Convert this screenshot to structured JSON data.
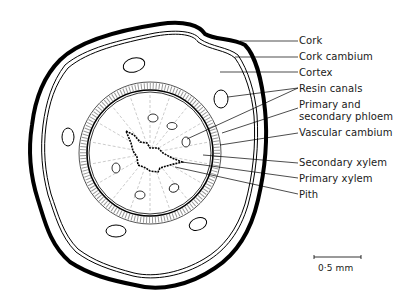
{
  "diagram": {
    "labels": [
      {
        "id": "cork",
        "text": "Cork",
        "x": 299,
        "y": 35
      },
      {
        "id": "cork-cambium",
        "text": "Cork cambium",
        "x": 299,
        "y": 51
      },
      {
        "id": "cortex",
        "text": "Cortex",
        "x": 299,
        "y": 67
      },
      {
        "id": "resin-canals",
        "text": "Resin canals",
        "x": 299,
        "y": 84
      },
      {
        "id": "primary-secondary-phloem-1",
        "text": "Primary and",
        "x": 299,
        "y": 99
      },
      {
        "id": "primary-secondary-phloem-2",
        "text": "secondary phloem",
        "x": 299,
        "y": 111
      },
      {
        "id": "vascular-cambium",
        "text": "Vascular cambium",
        "x": 299,
        "y": 127
      },
      {
        "id": "secondary-xylem",
        "text": "Secondary xylem",
        "x": 299,
        "y": 157
      },
      {
        "id": "primary-xylem",
        "text": "Primary xylem",
        "x": 299,
        "y": 173
      },
      {
        "id": "pith",
        "text": "Pith",
        "x": 299,
        "y": 189
      }
    ],
    "scale_bar": {
      "text": "0·5 mm",
      "x": 318,
      "y": 263
    }
  }
}
